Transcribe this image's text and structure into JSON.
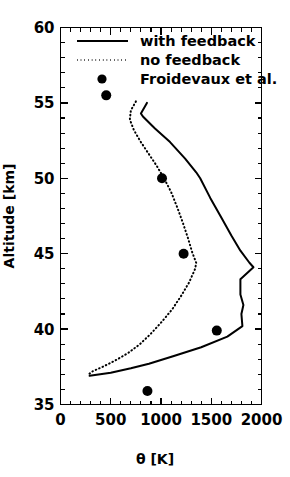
{
  "chart_data": {
    "type": "line",
    "title": "",
    "xlabel": "θ [K]",
    "ylabel": "Altitude [km]",
    "xlim": [
      0,
      2000
    ],
    "ylim": [
      35,
      60
    ],
    "xticks": [
      0,
      500,
      1000,
      1500,
      2000
    ],
    "xticklabels": [
      "0",
      "500",
      "1000",
      "1500",
      "2000"
    ],
    "yticks": [
      35,
      40,
      45,
      50,
      55,
      60
    ],
    "yticklabels": [
      "35",
      "40",
      "45",
      "50",
      "55",
      "60"
    ],
    "x_minor_tick_interval": 100,
    "y_minor_tick_interval": 1,
    "grid": false,
    "legend_position": "upper-left-inside",
    "series": [
      {
        "name": "with feedback",
        "style": "solid",
        "color": "#000000",
        "orientation": "x=theta, y=altitude",
        "points": [
          [
            860,
            55.0
          ],
          [
            800,
            54.3
          ],
          [
            820,
            54.1
          ],
          [
            940,
            53.3
          ],
          [
            1090,
            52.4
          ],
          [
            1240,
            51.3
          ],
          [
            1350,
            50.4
          ],
          [
            1390,
            50.0
          ],
          [
            1490,
            48.7
          ],
          [
            1600,
            47.4
          ],
          [
            1700,
            46.2
          ],
          [
            1790,
            45.2
          ],
          [
            1880,
            44.4
          ],
          [
            1920,
            44.1
          ],
          [
            1790,
            43.3
          ],
          [
            1790,
            42.3
          ],
          [
            1820,
            41.6
          ],
          [
            1800,
            41.0
          ],
          [
            1810,
            40.2
          ],
          [
            1660,
            39.5
          ],
          [
            1400,
            38.8
          ],
          [
            1120,
            38.2
          ],
          [
            880,
            37.7
          ],
          [
            700,
            37.4
          ],
          [
            500,
            37.1
          ],
          [
            290,
            36.9
          ]
        ]
      },
      {
        "name": "no feedback",
        "style": "dotted",
        "color": "#000000",
        "orientation": "x=theta, y=altitude",
        "points": [
          [
            750,
            55.1
          ],
          [
            700,
            54.5
          ],
          [
            690,
            53.9
          ],
          [
            730,
            53.2
          ],
          [
            800,
            52.4
          ],
          [
            880,
            51.6
          ],
          [
            960,
            50.8
          ],
          [
            1030,
            50.0
          ],
          [
            1100,
            49.1
          ],
          [
            1160,
            48.1
          ],
          [
            1220,
            47.0
          ],
          [
            1270,
            46.0
          ],
          [
            1310,
            45.1
          ],
          [
            1350,
            44.4
          ],
          [
            1340,
            44.0
          ],
          [
            1280,
            43.1
          ],
          [
            1200,
            42.2
          ],
          [
            1110,
            41.3
          ],
          [
            1010,
            40.5
          ],
          [
            900,
            39.7
          ],
          [
            790,
            39.0
          ],
          [
            670,
            38.4
          ],
          [
            540,
            37.9
          ],
          [
            420,
            37.5
          ],
          [
            320,
            37.2
          ],
          [
            280,
            37.0
          ]
        ]
      },
      {
        "name": "Froidevaux et al.",
        "style": "markers",
        "color": "#000000",
        "orientation": "x=theta, y=altitude",
        "points": [
          [
            455,
            55.5
          ],
          [
            1010,
            50.0
          ],
          [
            1225,
            45.0
          ],
          [
            1555,
            39.9
          ],
          [
            865,
            35.9
          ]
        ]
      }
    ]
  },
  "legend": {
    "entries": [
      {
        "label": "with feedback",
        "style": "solid"
      },
      {
        "label": "no feedback",
        "style": "dotted"
      },
      {
        "label": "Froidevaux et al.",
        "style": "marker"
      }
    ]
  },
  "colors": {
    "foreground": "#000000",
    "background": "#ffffff"
  }
}
